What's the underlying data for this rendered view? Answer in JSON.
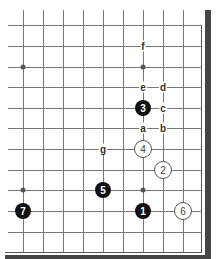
{
  "board": {
    "grid_x": [
      23,
      43,
      63,
      83,
      103,
      123,
      143,
      163,
      183
    ],
    "grid_y": [
      25,
      46,
      67,
      87,
      108,
      128,
      149,
      170,
      190,
      211,
      232
    ],
    "star_points": [
      {
        "x": 23,
        "y": 67
      },
      {
        "x": 143,
        "y": 67
      },
      {
        "x": 23,
        "y": 190
      },
      {
        "x": 143,
        "y": 190
      }
    ],
    "stones": [
      {
        "number": "1",
        "color": "black",
        "x": 143,
        "y": 211
      },
      {
        "number": "2",
        "color": "white",
        "x": 163,
        "y": 170
      },
      {
        "number": "3",
        "color": "black",
        "x": 143,
        "y": 108
      },
      {
        "number": "4",
        "color": "white",
        "x": 143,
        "y": 149
      },
      {
        "number": "5",
        "color": "black",
        "x": 103,
        "y": 190
      },
      {
        "number": "6",
        "color": "white",
        "x": 183,
        "y": 211
      },
      {
        "number": "7",
        "color": "black",
        "x": 23,
        "y": 211
      }
    ],
    "labels": [
      {
        "text": "f",
        "x": 143,
        "y": 46
      },
      {
        "text": "e",
        "x": 143,
        "y": 87
      },
      {
        "text": "d",
        "x": 163,
        "y": 87
      },
      {
        "text": "c",
        "x": 163,
        "y": 108
      },
      {
        "text": "a",
        "x": 143,
        "y": 128
      },
      {
        "text": "b",
        "x": 163,
        "y": 128
      },
      {
        "text": "g",
        "x": 103,
        "y": 149
      }
    ]
  }
}
